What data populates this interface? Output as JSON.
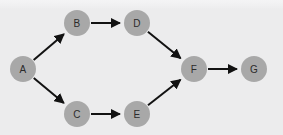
{
  "diagram": {
    "type": "directed-acyclic-graph",
    "title": "",
    "canvas": {
      "width": 283,
      "height": 135,
      "background_color": "#ececed",
      "top_band_color": "#f3f3f4"
    },
    "style": {
      "node_fill": "#a8a8a8",
      "node_radius": 13,
      "node_label_color": "#2b2b2b",
      "node_label_size": 10,
      "edge_color": "#121212",
      "edge_width": 2,
      "arrowhead": "solid-triangle"
    },
    "nodes": [
      {
        "id": "A",
        "label": "A",
        "x": 23,
        "y": 69
      },
      {
        "id": "B",
        "label": "B",
        "x": 77,
        "y": 23
      },
      {
        "id": "C",
        "label": "C",
        "x": 77,
        "y": 114
      },
      {
        "id": "D",
        "label": "D",
        "x": 137,
        "y": 23
      },
      {
        "id": "E",
        "label": "E",
        "x": 137,
        "y": 114
      },
      {
        "id": "F",
        "label": "F",
        "x": 194,
        "y": 69
      },
      {
        "id": "G",
        "label": "G",
        "x": 254,
        "y": 69
      }
    ],
    "edges": [
      {
        "id": "A-B",
        "from": "A",
        "to": "B",
        "directed": true
      },
      {
        "id": "A-C",
        "from": "A",
        "to": "C",
        "directed": true
      },
      {
        "id": "B-D",
        "from": "B",
        "to": "D",
        "directed": true
      },
      {
        "id": "C-E",
        "from": "C",
        "to": "E",
        "directed": true
      },
      {
        "id": "D-F",
        "from": "D",
        "to": "F",
        "directed": true
      },
      {
        "id": "E-F",
        "from": "E",
        "to": "F",
        "directed": true
      },
      {
        "id": "F-G",
        "from": "F",
        "to": "G",
        "directed": true
      }
    ]
  }
}
